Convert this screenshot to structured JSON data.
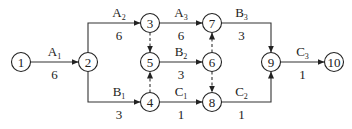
{
  "diagram": {
    "type": "activity-on-arrow network",
    "nodes": [
      "1",
      "2",
      "3",
      "4",
      "5",
      "6",
      "7",
      "8",
      "9",
      "10"
    ],
    "activities": [
      {
        "from": "1",
        "to": "2",
        "name": "A",
        "sub": "1",
        "duration": "6"
      },
      {
        "from": "2",
        "to": "3",
        "name": "A",
        "sub": "2",
        "duration": "6"
      },
      {
        "from": "3",
        "to": "7",
        "name": "A",
        "sub": "3",
        "duration": "6"
      },
      {
        "from": "2",
        "to": "4",
        "name": "B",
        "sub": "1",
        "duration": "3"
      },
      {
        "from": "5",
        "to": "6",
        "name": "B",
        "sub": "2",
        "duration": "3"
      },
      {
        "from": "7",
        "to": "9",
        "name": "B",
        "sub": "3",
        "duration": "3"
      },
      {
        "from": "4",
        "to": "8",
        "name": "C",
        "sub": "1",
        "duration": "1"
      },
      {
        "from": "8",
        "to": "9",
        "name": "C",
        "sub": "2",
        "duration": "1"
      },
      {
        "from": "9",
        "to": "10",
        "name": "C",
        "sub": "3",
        "duration": "1"
      }
    ],
    "dummies": [
      {
        "from": "3",
        "to": "5"
      },
      {
        "from": "4",
        "to": "5"
      },
      {
        "from": "6",
        "to": "7"
      },
      {
        "from": "6",
        "to": "8"
      }
    ]
  }
}
